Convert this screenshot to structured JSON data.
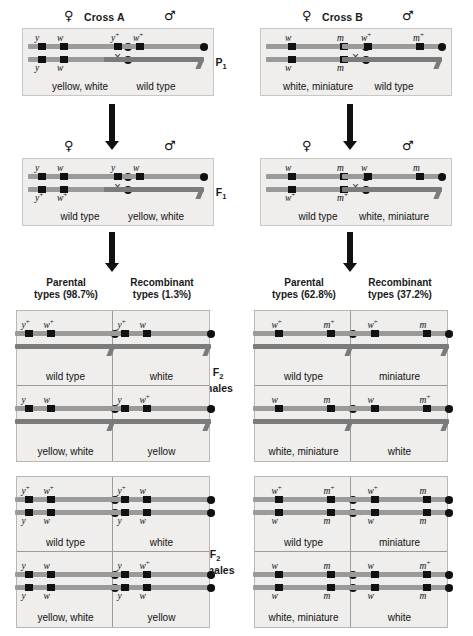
{
  "page": {
    "bg": "#ffffff",
    "panel_bg": "#efeeec",
    "ink": "#111111"
  },
  "symbols": {
    "female": "♀",
    "male": "♂",
    "times": "×"
  },
  "generations": [
    {
      "id": "p1",
      "label": "P",
      "sub": "1"
    },
    {
      "id": "f1",
      "label": "F",
      "sub": "1"
    },
    {
      "id": "f2males",
      "label": "F",
      "sub": "2",
      "line2": "males"
    },
    {
      "id": "f2females",
      "label": "F",
      "sub": "2",
      "line2": "females"
    }
  ],
  "crosses": [
    {
      "id": "cross-a",
      "title": "Cross A",
      "genes": [
        "y",
        "w"
      ],
      "parental_header": {
        "line1": "Parental",
        "line2": "types (98.7%)",
        "percent": "98.7%"
      },
      "recombinant_header": {
        "line1": "Recombinant",
        "line2": "types (1.3%)",
        "percent": "1.3%"
      },
      "p1": {
        "female": {
          "sex": "female",
          "top_alleles": [
            "y",
            "w"
          ],
          "bottom_alleles": [
            "y",
            "w"
          ],
          "phenotype": "yellow, white"
        },
        "male": {
          "sex": "male",
          "top_alleles": [
            "y+",
            "w+"
          ],
          "phenotype": "wild type"
        }
      },
      "f1": {
        "female": {
          "sex": "female",
          "top_alleles": [
            "y",
            "w"
          ],
          "bottom_alleles": [
            "y+",
            "w+"
          ],
          "phenotype": "wild type"
        },
        "male": {
          "sex": "male",
          "top_alleles": [
            "y",
            "w"
          ],
          "phenotype": "yellow, white"
        }
      },
      "f2_males": [
        {
          "col": "parental",
          "row": 0,
          "top_alleles": [
            "y+",
            "w+"
          ],
          "phenotype": "wild type"
        },
        {
          "col": "recombinant",
          "row": 0,
          "top_alleles": [
            "y+",
            "w"
          ],
          "phenotype": "white"
        },
        {
          "col": "parental",
          "row": 1,
          "top_alleles": [
            "y",
            "w"
          ],
          "phenotype": "yellow, white"
        },
        {
          "col": "recombinant",
          "row": 1,
          "top_alleles": [
            "y",
            "w+"
          ],
          "phenotype": "yellow"
        }
      ],
      "f2_females": [
        {
          "col": "parental",
          "row": 0,
          "top_alleles": [
            "y+",
            "w+"
          ],
          "bottom_alleles": [
            "y",
            "w"
          ],
          "phenotype": "wild type"
        },
        {
          "col": "recombinant",
          "row": 0,
          "top_alleles": [
            "y+",
            "w"
          ],
          "bottom_alleles": [
            "y",
            "w"
          ],
          "phenotype": "white"
        },
        {
          "col": "parental",
          "row": 1,
          "top_alleles": [
            "y",
            "w"
          ],
          "bottom_alleles": [
            "y",
            "w"
          ],
          "phenotype": "yellow, white"
        },
        {
          "col": "recombinant",
          "row": 1,
          "top_alleles": [
            "y",
            "w+"
          ],
          "bottom_alleles": [
            "y",
            "w"
          ],
          "phenotype": "yellow"
        }
      ]
    },
    {
      "id": "cross-b",
      "title": "Cross B",
      "genes": [
        "w",
        "m"
      ],
      "parental_header": {
        "line1": "Parental",
        "line2": "types (62.8%)",
        "percent": "62.8%"
      },
      "recombinant_header": {
        "line1": "Recombinant",
        "line2": "types (37.2%)",
        "percent": "37.2%"
      },
      "p1": {
        "female": {
          "sex": "female",
          "top_alleles": [
            "w",
            "m"
          ],
          "bottom_alleles": [
            "w",
            "m"
          ],
          "phenotype": "white, miniature"
        },
        "male": {
          "sex": "male",
          "top_alleles": [
            "w+",
            "m+"
          ],
          "phenotype": "wild type"
        }
      },
      "f1": {
        "female": {
          "sex": "female",
          "top_alleles": [
            "w",
            "m"
          ],
          "bottom_alleles": [
            "w+",
            "m+"
          ],
          "phenotype": "wild type"
        },
        "male": {
          "sex": "male",
          "top_alleles": [
            "w",
            "m"
          ],
          "phenotype": "white, miniature"
        }
      },
      "f2_males": [
        {
          "col": "parental",
          "row": 0,
          "top_alleles": [
            "w+",
            "m+"
          ],
          "phenotype": "wild type"
        },
        {
          "col": "recombinant",
          "row": 0,
          "top_alleles": [
            "w+",
            "m"
          ],
          "phenotype": "miniature"
        },
        {
          "col": "parental",
          "row": 1,
          "top_alleles": [
            "w",
            "m"
          ],
          "phenotype": "white, miniature"
        },
        {
          "col": "recombinant",
          "row": 1,
          "top_alleles": [
            "w",
            "m+"
          ],
          "phenotype": "white"
        }
      ],
      "f2_females": [
        {
          "col": "parental",
          "row": 0,
          "top_alleles": [
            "w+",
            "m+"
          ],
          "bottom_alleles": [
            "w",
            "m"
          ],
          "phenotype": "wild type"
        },
        {
          "col": "recombinant",
          "row": 0,
          "top_alleles": [
            "w+",
            "m"
          ],
          "bottom_alleles": [
            "w",
            "m"
          ],
          "phenotype": "miniature"
        },
        {
          "col": "parental",
          "row": 1,
          "top_alleles": [
            "w",
            "m"
          ],
          "bottom_alleles": [
            "w",
            "m"
          ],
          "phenotype": "white, miniature"
        },
        {
          "col": "recombinant",
          "row": 1,
          "top_alleles": [
            "w",
            "m+"
          ],
          "bottom_alleles": [
            "w",
            "m"
          ],
          "phenotype": "white"
        }
      ]
    }
  ]
}
